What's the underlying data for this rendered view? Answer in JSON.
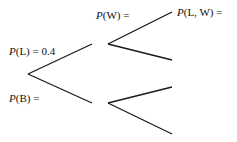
{
  "diagram": {
    "type": "probability-tree",
    "labels": {
      "p_l": {
        "func": "P",
        "arg": "(L) = 0.4"
      },
      "p_b": {
        "func": "P",
        "arg": "(B) ="
      },
      "p_w": {
        "func": "P",
        "arg": "(W) ="
      },
      "p_lw": {
        "func": "P",
        "arg": "(L, W) ="
      }
    },
    "line_color": "#1a1a1a"
  }
}
